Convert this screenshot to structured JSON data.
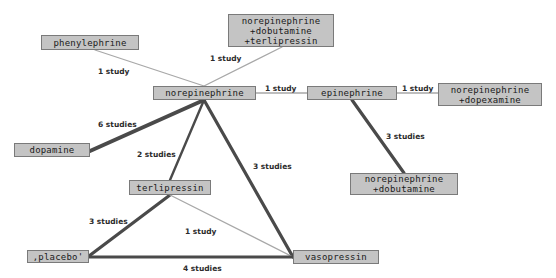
{
  "diagram": {
    "type": "network-meta-analysis",
    "colors": {
      "node_fill": "#c4c4c4",
      "node_border": "#7a7a7a",
      "edge_thin": "#a8a8a8",
      "edge_thick": "#4a4a4a"
    },
    "nodes": [
      {
        "id": "phenylephrine",
        "label": "phenylephrine",
        "x": 41,
        "y": 35,
        "w": 98,
        "h": 15
      },
      {
        "id": "ne_dobu_terli",
        "label": "norepinephrine\n+dobutamine\n+terlipressin",
        "x": 228,
        "y": 14,
        "w": 106,
        "h": 33
      },
      {
        "id": "norepinephrine",
        "label": "norepinephrine",
        "x": 153,
        "y": 86,
        "w": 103,
        "h": 14
      },
      {
        "id": "epinephrine",
        "label": "epinephrine",
        "x": 307,
        "y": 86,
        "w": 90,
        "h": 14
      },
      {
        "id": "ne_dopex",
        "label": "norepinephrine\n+dopexamine",
        "x": 438,
        "y": 83,
        "w": 104,
        "h": 23
      },
      {
        "id": "dopamine",
        "label": "dopamine",
        "x": 14,
        "y": 143,
        "w": 76,
        "h": 14
      },
      {
        "id": "terlipressin",
        "label": "terlipressin",
        "x": 129,
        "y": 180,
        "w": 82,
        "h": 15
      },
      {
        "id": "ne_dobu",
        "label": "norepinephrine\n+dobutamine",
        "x": 350,
        "y": 173,
        "w": 108,
        "h": 22
      },
      {
        "id": "placebo",
        "label": ",placebo'",
        "x": 27,
        "y": 250,
        "w": 62,
        "h": 13
      },
      {
        "id": "vasopressin",
        "label": "vasopressin",
        "x": 293,
        "y": 250,
        "w": 86,
        "h": 14
      }
    ],
    "edges": [
      {
        "from": "phenylephrine",
        "to": "norepinephrine",
        "label": "1 study",
        "studies": 1,
        "x1": 95,
        "y1": 50,
        "x2": 204,
        "y2": 86,
        "label_x": 98,
        "label_y": 67
      },
      {
        "from": "ne_dobu_terli",
        "to": "norepinephrine",
        "label": "1 study",
        "studies": 1,
        "x1": 282,
        "y1": 47,
        "x2": 204,
        "y2": 86,
        "label_x": 210,
        "label_y": 54
      },
      {
        "from": "norepinephrine",
        "to": "epinephrine",
        "label": "1 study",
        "studies": 1,
        "x1": 256,
        "y1": 93,
        "x2": 307,
        "y2": 93,
        "label_x": 265,
        "label_y": 84
      },
      {
        "from": "epinephrine",
        "to": "ne_dopex",
        "label": "1 study",
        "studies": 1,
        "x1": 397,
        "y1": 93,
        "x2": 438,
        "y2": 93,
        "label_x": 402,
        "label_y": 84
      },
      {
        "from": "norepinephrine",
        "to": "dopamine",
        "label": "6 studies",
        "studies": 6,
        "x1": 204,
        "y1": 100,
        "x2": 90,
        "y2": 151,
        "label_x": 98,
        "label_y": 120
      },
      {
        "from": "norepinephrine",
        "to": "terlipressin",
        "label": "2 studies",
        "studies": 2,
        "x1": 204,
        "y1": 100,
        "x2": 170,
        "y2": 180,
        "label_x": 137,
        "label_y": 150
      },
      {
        "from": "norepinephrine",
        "to": "vasopressin",
        "label": "3 studies",
        "studies": 3,
        "x1": 204,
        "y1": 100,
        "x2": 293,
        "y2": 257,
        "label_x": 253,
        "label_y": 162
      },
      {
        "from": "epinephrine",
        "to": "ne_dobu",
        "label": "3 studies",
        "studies": 3,
        "x1": 352,
        "y1": 100,
        "x2": 404,
        "y2": 173,
        "label_x": 386,
        "label_y": 132
      },
      {
        "from": "terlipressin",
        "to": "placebo",
        "label": "3 studies",
        "studies": 3,
        "x1": 170,
        "y1": 195,
        "x2": 89,
        "y2": 256,
        "label_x": 89,
        "label_y": 217
      },
      {
        "from": "terlipressin",
        "to": "vasopressin",
        "label": "1 study",
        "studies": 1,
        "x1": 170,
        "y1": 195,
        "x2": 293,
        "y2": 257,
        "label_x": 185,
        "label_y": 227
      },
      {
        "from": "placebo",
        "to": "vasopressin",
        "label": "4 studies",
        "studies": 4,
        "x1": 89,
        "y1": 257,
        "x2": 293,
        "y2": 257,
        "label_x": 183,
        "label_y": 264
      }
    ]
  }
}
